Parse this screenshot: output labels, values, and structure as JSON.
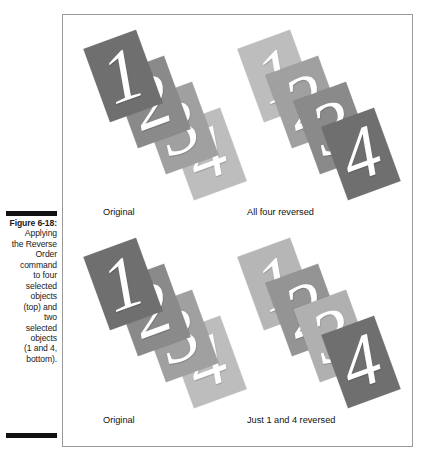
{
  "figure": {
    "label": "Figure 6-18:",
    "caption_lines": [
      "Applying",
      "the Reverse",
      "Order",
      "command",
      "to four",
      "selected",
      "objects",
      "(top) and",
      "two",
      "selected",
      "objects",
      "(1 and 4,",
      "bottom)."
    ]
  },
  "colors": {
    "darkest": "#6f6f6f",
    "dark": "#8a8a8a",
    "mid": "#9d9d9d",
    "light": "#b6b6b6",
    "lightest": "#c6c6c6",
    "numeral": "#ffffff",
    "frame_border": "#9a9a9a",
    "rule": "#111111"
  },
  "panels": [
    {
      "id": "original-top",
      "label": "Original",
      "cards": [
        {
          "number": "1",
          "pos": "pos1",
          "shade": "#6f6f6f",
          "z": 4
        },
        {
          "number": "2",
          "pos": "pos2",
          "shade": "#8a8a8a",
          "z": 3
        },
        {
          "number": "3",
          "pos": "pos3",
          "shade": "#a0a0a0",
          "z": 2
        },
        {
          "number": "4",
          "pos": "pos4",
          "shade": "#bdbdbd",
          "z": 1
        }
      ]
    },
    {
      "id": "all-four-reversed",
      "label": "All four reversed",
      "cards": [
        {
          "number": "1",
          "pos": "pos1",
          "shade": "#bdbdbd",
          "z": 1
        },
        {
          "number": "2",
          "pos": "pos2",
          "shade": "#a0a0a0",
          "z": 2
        },
        {
          "number": "3",
          "pos": "pos3",
          "shade": "#8a8a8a",
          "z": 3
        },
        {
          "number": "4",
          "pos": "pos4",
          "shade": "#6f6f6f",
          "z": 4
        }
      ]
    },
    {
      "id": "original-bottom",
      "label": "Original",
      "cards": [
        {
          "number": "1",
          "pos": "pos1",
          "shade": "#6f6f6f",
          "z": 4
        },
        {
          "number": "2",
          "pos": "pos2",
          "shade": "#8a8a8a",
          "z": 3
        },
        {
          "number": "3",
          "pos": "pos3",
          "shade": "#a0a0a0",
          "z": 2
        },
        {
          "number": "4",
          "pos": "pos4",
          "shade": "#bdbdbd",
          "z": 1
        }
      ]
    },
    {
      "id": "just-1-and-4-reversed",
      "label": "Just 1 and 4 reversed",
      "cards": [
        {
          "number": "1",
          "pos": "pos1",
          "shade": "#b6b6b6",
          "z": 1
        },
        {
          "number": "2",
          "pos": "pos2",
          "shade": "#949494",
          "z": 2
        },
        {
          "number": "3",
          "pos": "pos3",
          "shade": "#b0b0b0",
          "z": 3
        },
        {
          "number": "4",
          "pos": "pos4",
          "shade": "#6f6f6f",
          "z": 4
        }
      ]
    }
  ]
}
